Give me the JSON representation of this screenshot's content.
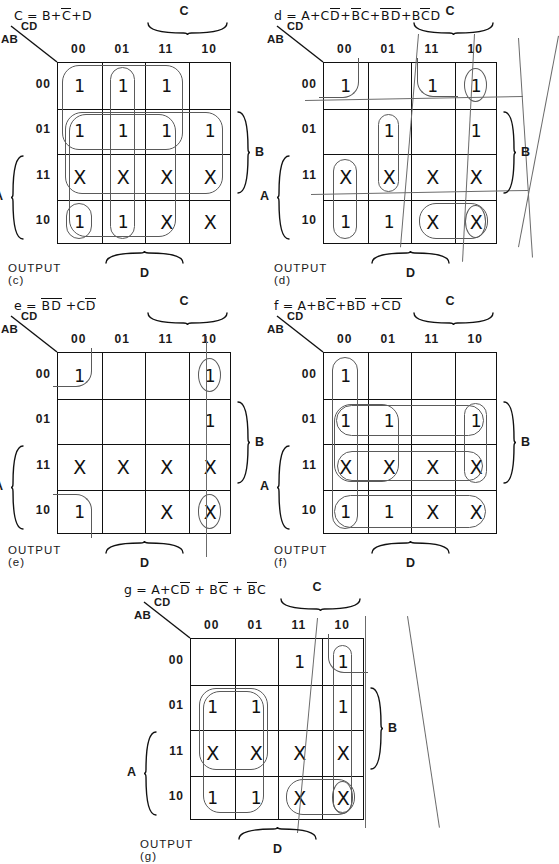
{
  "figure": {
    "grid_labels": {
      "cd": "CD",
      "ab": "AB",
      "columns": [
        "00",
        "01",
        "11",
        "10"
      ],
      "rows": [
        "00",
        "01",
        "11",
        "10"
      ],
      "brace_c": "C",
      "brace_b": "B",
      "brace_a": "A",
      "brace_d": "D"
    }
  },
  "maps": [
    {
      "id": "c",
      "equation": "C = B+C̄+D",
      "equation_parts": [
        {
          "t": "C = B+",
          "bar": false
        },
        {
          "t": "C",
          "bar": true
        },
        {
          "t": "+D",
          "bar": false
        }
      ],
      "output_label": "OUTPUT (c)",
      "output_letter": "c",
      "cells": [
        [
          "1",
          "1",
          "1",
          ""
        ],
        [
          "1",
          "1",
          "1",
          "1"
        ],
        [
          "X",
          "X",
          "X",
          "X"
        ],
        [
          "1",
          "1",
          "X",
          "X"
        ]
      ]
    },
    {
      "id": "d",
      "equation": "d = A+CD̄+B̄C+B̄D̄+BC̄D",
      "equation_parts": [
        {
          "t": "d = A+C",
          "bar": false
        },
        {
          "t": "D",
          "bar": true
        },
        {
          "t": "+",
          "bar": false
        },
        {
          "t": "B",
          "bar": true
        },
        {
          "t": "C+",
          "bar": false
        },
        {
          "t": "B",
          "bar": true
        },
        {
          "t": "D",
          "bar": true
        },
        {
          "t": "+B",
          "bar": false
        },
        {
          "t": "C",
          "bar": true
        },
        {
          "t": "D",
          "bar": false
        }
      ],
      "output_label": "OUTPUT (d)",
      "output_letter": "d",
      "cells": [
        [
          "1",
          "",
          "1",
          "1"
        ],
        [
          "",
          "1",
          "",
          "1"
        ],
        [
          "X",
          "X",
          "X",
          "X"
        ],
        [
          "1",
          "1",
          "X",
          "X"
        ]
      ]
    },
    {
      "id": "e",
      "equation": "e = B̄D̄ +CD̄",
      "equation_parts": [
        {
          "t": "e = ",
          "bar": false
        },
        {
          "t": "B",
          "bar": true
        },
        {
          "t": "D",
          "bar": true
        },
        {
          "t": " +C",
          "bar": false
        },
        {
          "t": "D",
          "bar": true
        }
      ],
      "output_label": "OUTPUT (e)",
      "output_letter": "e",
      "cells": [
        [
          "1",
          "",
          "",
          "1"
        ],
        [
          "",
          "",
          "",
          "1"
        ],
        [
          "X",
          "X",
          "X",
          "X"
        ],
        [
          "1",
          "",
          "X",
          "X"
        ]
      ]
    },
    {
      "id": "f",
      "equation": "f = A+BC̄+BD̄ +C̄D̄",
      "equation_parts": [
        {
          "t": "f = A+B",
          "bar": false
        },
        {
          "t": "C",
          "bar": true
        },
        {
          "t": "+B",
          "bar": false
        },
        {
          "t": "D",
          "bar": true
        },
        {
          "t": " +",
          "bar": false
        },
        {
          "t": "C",
          "bar": true
        },
        {
          "t": "D",
          "bar": true
        }
      ],
      "output_label": "OUTPUT (f)",
      "output_letter": "f",
      "cells": [
        [
          "1",
          "",
          "",
          ""
        ],
        [
          "1",
          "1",
          "",
          "1"
        ],
        [
          "X",
          "X",
          "X",
          "X"
        ],
        [
          "1",
          "1",
          "X",
          "X"
        ]
      ]
    },
    {
      "id": "g",
      "equation": "g = A+CD̄ + BC̄ + B̄C",
      "equation_parts": [
        {
          "t": "g = A+C",
          "bar": false
        },
        {
          "t": "D",
          "bar": true
        },
        {
          "t": " + B",
          "bar": false
        },
        {
          "t": "C",
          "bar": true
        },
        {
          "t": " + ",
          "bar": false
        },
        {
          "t": "B",
          "bar": true
        },
        {
          "t": "C",
          "bar": false
        }
      ],
      "output_label": "OUTPUT (g)",
      "output_letter": "g",
      "cells": [
        [
          "",
          "",
          "1",
          "1"
        ],
        [
          "1",
          "1",
          "",
          "1"
        ],
        [
          "X",
          "X",
          "X",
          "X"
        ],
        [
          "1",
          "1",
          "X",
          "X"
        ]
      ]
    }
  ],
  "colors": {
    "ink": "#111111",
    "loop": "#6b6b6b",
    "paper": "#ffffff"
  }
}
